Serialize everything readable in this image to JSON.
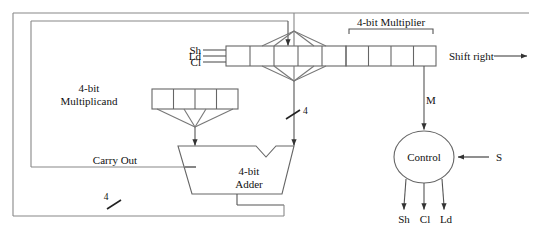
{
  "diagram": {
    "line_color": "#555555",
    "text_color": "#111111",
    "labels": {
      "multiplicand_line1": "4-bit",
      "multiplicand_line2": "Multiplicand",
      "multiplier_bracket": "4-bit Multiplier",
      "adder_line1": "4-bit",
      "adder_line2": "Adder",
      "control": "Control",
      "carry_out": "Carry Out",
      "shift_right": "Shift right",
      "bus_width_adder_input": "4",
      "bus_width_feedback": "4",
      "signal_m": "M",
      "signal_s": "S",
      "reg_input_sh": "Sh",
      "reg_input_ld": "Ld",
      "reg_input_cl": "Cl",
      "control_out_sh": "Sh",
      "control_out_cl": "Cl",
      "control_out_ld": "Ld"
    },
    "registers": {
      "accumulator": {
        "cells": 5,
        "x": 226,
        "y": 46,
        "cell_width": 24,
        "height": 20
      },
      "multiplier": {
        "cells": 4,
        "x": 346,
        "y": 46,
        "cell_width": 22.5,
        "height": 20
      },
      "multiplicand": {
        "cells": 4,
        "x": 152,
        "y": 89,
        "cell_width": 21.5,
        "height": 20
      }
    },
    "control_block": {
      "cx": 424,
      "cy": 157,
      "rx": 30,
      "ry": 26
    },
    "adder_block": {
      "x": 178,
      "y": 146,
      "width": 116,
      "height": 48
    }
  }
}
